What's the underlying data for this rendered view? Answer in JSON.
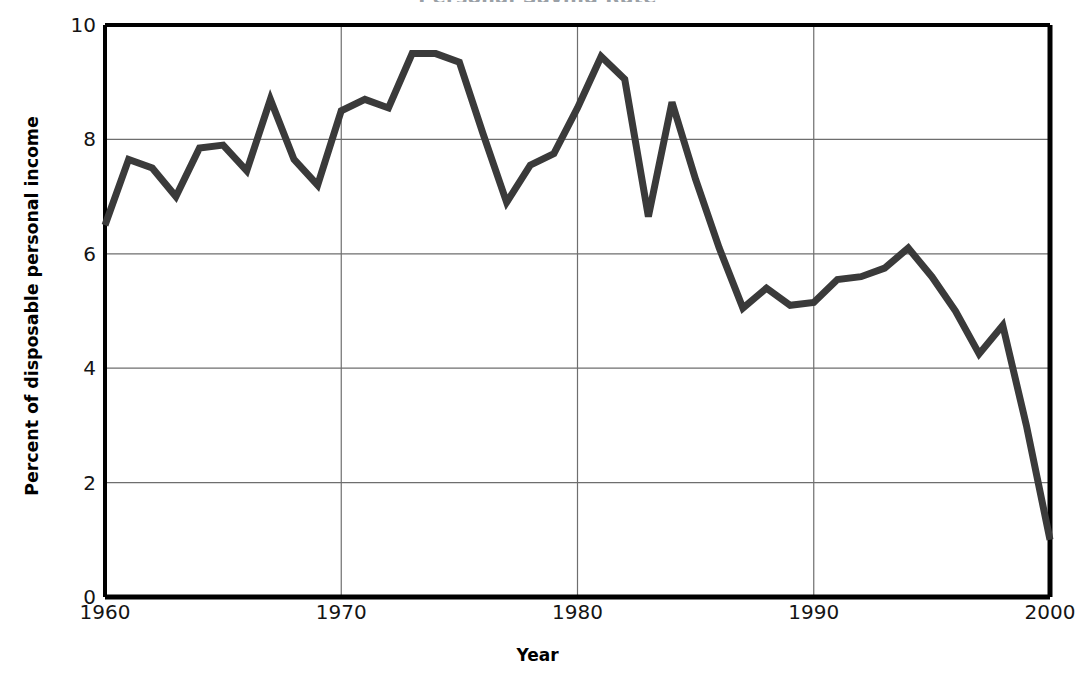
{
  "chart_data": {
    "type": "line",
    "title": "Personal Saving Rate",
    "xlabel": "Year",
    "ylabel": "Percent of disposable personal income",
    "xlim": [
      1960,
      2000
    ],
    "ylim": [
      0,
      10
    ],
    "yticks": [
      "0",
      "2",
      "4",
      "6",
      "8",
      "10"
    ],
    "ytick_values": [
      0,
      2,
      4,
      6,
      8,
      10
    ],
    "xticks": [
      "1960",
      "1970",
      "1980",
      "1990",
      "2000"
    ],
    "xtick_values": [
      1960,
      1970,
      1980,
      1990,
      2000
    ],
    "grid": true,
    "legend": "none",
    "line_color": "#3a3a3a",
    "axis_color": "#000000",
    "grid_color": "#6e6e6e",
    "background": "#ffffff",
    "x": [
      1960,
      1961,
      1962,
      1963,
      1964,
      1965,
      1966,
      1967,
      1968,
      1969,
      1970,
      1971,
      1972,
      1973,
      1974,
      1975,
      1976,
      1977,
      1978,
      1979,
      1980,
      1981,
      1982,
      1983,
      1984,
      1985,
      1986,
      1987,
      1988,
      1989,
      1990,
      1991,
      1992,
      1993,
      1994,
      1995,
      1996,
      1997,
      1998,
      1999,
      2000
    ],
    "values": [
      6.5,
      7.65,
      7.5,
      7.0,
      7.85,
      7.9,
      7.45,
      8.7,
      7.65,
      7.2,
      8.5,
      8.7,
      8.55,
      9.5,
      9.5,
      9.35,
      8.1,
      6.9,
      7.55,
      7.75,
      8.55,
      9.45,
      9.05,
      6.65,
      8.65,
      7.3,
      6.1,
      5.05,
      5.4,
      5.1,
      5.15,
      5.55,
      5.6,
      5.75,
      6.1,
      5.6,
      5.0,
      4.25,
      4.75,
      3.0,
      1.0
    ],
    "series": [
      {
        "name": "Personal saving rate",
        "values": [
          6.5,
          7.65,
          7.5,
          7.0,
          7.85,
          7.9,
          7.45,
          8.7,
          7.65,
          7.2,
          8.5,
          8.7,
          8.55,
          9.5,
          9.5,
          9.35,
          8.1,
          6.9,
          7.55,
          7.75,
          8.55,
          9.45,
          9.05,
          6.65,
          8.65,
          7.3,
          6.1,
          5.05,
          5.4,
          5.1,
          5.15,
          5.55,
          5.6,
          5.75,
          6.1,
          5.6,
          5.0,
          4.25,
          4.75,
          3.0,
          1.0
        ]
      }
    ]
  }
}
